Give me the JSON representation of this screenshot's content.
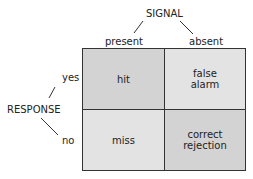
{
  "signal": {
    "title": "SIGNAL",
    "present": "present",
    "absent": "absent"
  },
  "response": {
    "title": "RESPONSE",
    "yes": "yes",
    "no": "no"
  },
  "cells": {
    "hit": {
      "label": "hit",
      "color": "#d3d3d3"
    },
    "false_alarm": {
      "line1": "false",
      "line2": "alarm",
      "color": "#e3e3e3"
    },
    "miss": {
      "label": "miss",
      "color": "#e3e3e3"
    },
    "correct_rejection": {
      "line1": "correct",
      "line2": "rejection",
      "color": "#d3d3d3"
    }
  }
}
